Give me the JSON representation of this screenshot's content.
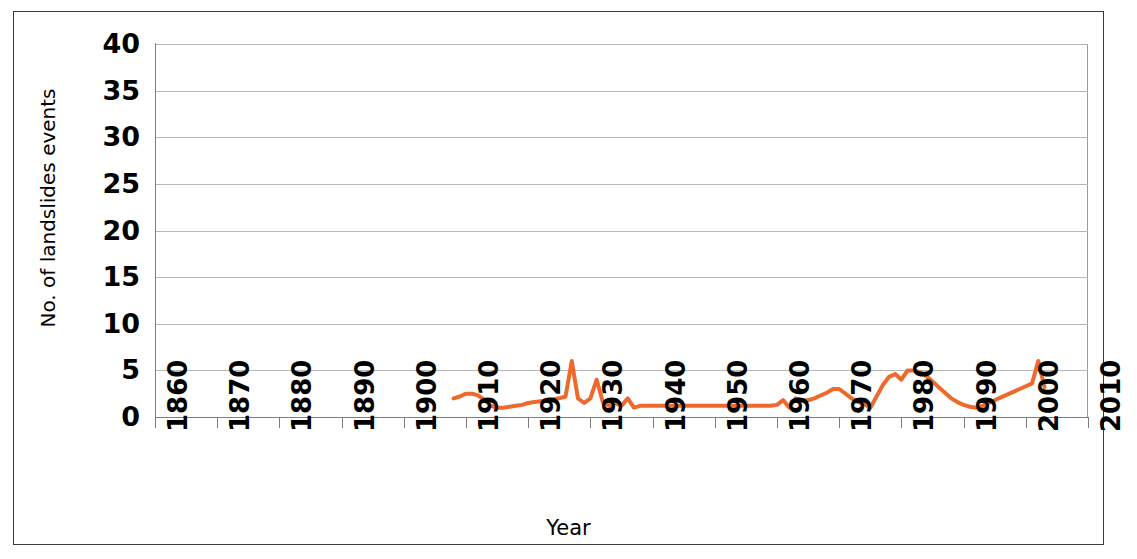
{
  "chart_data": {
    "type": "line",
    "title": "",
    "xlabel": "Year",
    "ylabel": "No. of landslides events",
    "xlim": [
      1860,
      2010
    ],
    "ylim": [
      0,
      40
    ],
    "xticks": [
      "1860",
      "1870",
      "1880",
      "1890",
      "1900",
      "1910",
      "1920",
      "1930",
      "1940",
      "1950",
      "1960",
      "1970",
      "1980",
      "1990",
      "2000",
      "2010"
    ],
    "yticks": [
      "0",
      "5",
      "10",
      "15",
      "20",
      "25",
      "30",
      "35",
      "40"
    ],
    "ytick_step": 5,
    "xtick_step": 10,
    "grid": "horizontal",
    "legend": "none",
    "series": [
      {
        "name": "No. of landslides events",
        "color": "#ED6A2C",
        "line_width": 4,
        "x": [
          1908,
          1909,
          1910,
          1911,
          1912,
          1913,
          1914,
          1915,
          1916,
          1917,
          1918,
          1919,
          1920,
          1921,
          1922,
          1923,
          1924,
          1925,
          1926,
          1927,
          1928,
          1929,
          1930,
          1931,
          1932,
          1933,
          1934,
          1935,
          1936,
          1937,
          1938,
          1939,
          1940,
          1941,
          1942,
          1943,
          1944,
          1945,
          1946,
          1947,
          1948,
          1949,
          1950,
          1951,
          1952,
          1953,
          1954,
          1955,
          1956,
          1957,
          1958,
          1959,
          1960,
          1961,
          1962,
          1963,
          1964,
          1965,
          1966,
          1967,
          1968,
          1969,
          1970,
          1971,
          1972,
          1973,
          1974,
          1975,
          1976,
          1977,
          1978,
          1979,
          1980,
          1981,
          1982,
          1983,
          1984,
          1985,
          1986,
          1987,
          1988,
          1989,
          1990,
          1991,
          1992,
          1993,
          1994,
          1995,
          1996,
          1997,
          1998,
          1999,
          2000,
          2001,
          2002,
          2003
        ],
        "values": [
          2,
          2.2,
          2.5,
          2.5,
          2.3,
          1.8,
          1.2,
          1,
          1,
          1.1,
          1.2,
          1.3,
          1.5,
          1.6,
          1.7,
          1.8,
          1.9,
          2,
          2.2,
          6,
          2,
          1.5,
          2,
          4,
          1.6,
          1.2,
          1.5,
          1.2,
          2,
          1,
          1.2,
          1.2,
          1.2,
          1.2,
          1.2,
          1.2,
          1.2,
          1.2,
          1.2,
          1.2,
          1.2,
          1.2,
          1.2,
          1.2,
          1.2,
          1.2,
          1.2,
          1.2,
          1.2,
          1.2,
          1.2,
          1.2,
          1.3,
          1.8,
          1,
          2,
          1.8,
          1.8,
          2,
          2.3,
          2.6,
          3,
          3,
          2.5,
          2,
          1.6,
          1.4,
          1,
          2.2,
          3.4,
          4.3,
          4.6,
          4,
          5,
          5,
          4.8,
          4.4,
          3.8,
          3.2,
          2.6,
          2,
          1.6,
          1.3,
          1.1,
          1,
          1.2,
          1.5,
          1.8,
          2.1,
          2.4,
          2.7,
          3,
          3.3,
          3.6,
          6,
          3.2
        ],
        "data_start_year": 1908,
        "data_end_year": 2003,
        "max_value": 6,
        "min_value": 1
      }
    ]
  },
  "axes": {
    "x_title": "Year",
    "y_title": "No. of landslides events"
  }
}
